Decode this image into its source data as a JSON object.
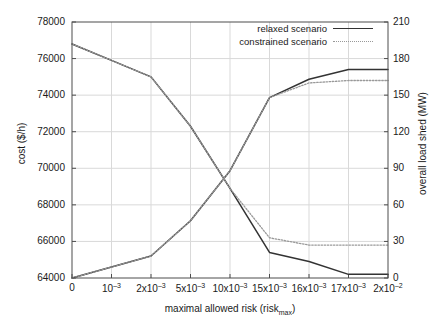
{
  "chart_data": {
    "type": "line",
    "title": "",
    "xlabel": "maximal allowed risk (risk_max)",
    "xlabel_main": "maximal allowed risk (risk",
    "xlabel_sub": "max",
    "xlabel_close": ")",
    "ylabel_left": "cost ($/h)",
    "ylabel_right": "overall load shed (MW)",
    "categories": [
      "0",
      "10⁻³",
      "2x10⁻³",
      "5x10⁻³",
      "10x10⁻³",
      "15x10⁻³",
      "16x10⁻³",
      "17x10⁻³",
      "2x10⁻²"
    ],
    "xtick_parts": [
      {
        "base": "0",
        "exp": ""
      },
      {
        "base": "10",
        "exp": "–3"
      },
      {
        "base": "2x10",
        "exp": "–3"
      },
      {
        "base": "5x10",
        "exp": "–3"
      },
      {
        "base": "10x10",
        "exp": "–3"
      },
      {
        "base": "15x10",
        "exp": "–3"
      },
      {
        "base": "16x10",
        "exp": "–3"
      },
      {
        "base": "17x10",
        "exp": "–3"
      },
      {
        "base": "2x10",
        "exp": "–2"
      }
    ],
    "ylim_left": [
      64000,
      78000
    ],
    "yticks_left": [
      64000,
      66000,
      68000,
      70000,
      72000,
      74000,
      76000,
      78000
    ],
    "ylim_right": [
      0,
      210
    ],
    "yticks_right": [
      0,
      30,
      60,
      90,
      120,
      150,
      180,
      210
    ],
    "grid": true,
    "legend_position": "top-right",
    "series": [
      {
        "name": "relaxed scenario",
        "style": "solid",
        "color": "#333333",
        "axis": "left",
        "metric": "cost",
        "values": [
          76800,
          75900,
          75000,
          72300,
          68900,
          65400,
          64900,
          64200,
          64200
        ]
      },
      {
        "name": "relaxed scenario",
        "style": "solid",
        "color": "#333333",
        "axis": "right",
        "metric": "overall load shed",
        "values": [
          0,
          9,
          18,
          47,
          88,
          148,
          163,
          171,
          171
        ]
      },
      {
        "name": "constrained scenario",
        "style": "dotted",
        "color": "#999999",
        "axis": "left",
        "metric": "cost",
        "values": [
          76800,
          75900,
          75000,
          72300,
          68900,
          66200,
          65800,
          65800,
          65800
        ]
      },
      {
        "name": "constrained scenario",
        "style": "dotted",
        "color": "#999999",
        "axis": "right",
        "metric": "overall load shed",
        "values": [
          0,
          9,
          18,
          47,
          88,
          148,
          160,
          162,
          162
        ]
      }
    ],
    "legend": [
      {
        "label": "relaxed scenario",
        "style": "solid"
      },
      {
        "label": "constrained scenario",
        "style": "dotted"
      }
    ],
    "colors": {
      "solid_line": "#333333",
      "dotted_line": "#999999",
      "grid": "#d9d9d9",
      "axis": "#4d4d4d",
      "background": "#ffffff"
    }
  }
}
